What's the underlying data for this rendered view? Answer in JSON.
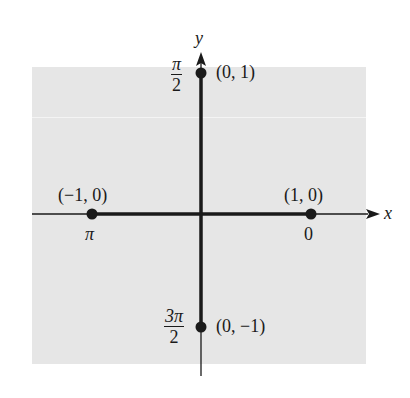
{
  "diagram": {
    "axes": {
      "x_label": "x",
      "y_label": "y"
    },
    "colors": {
      "background_box": "#e6e6e6",
      "ink": "#1a1a1a"
    },
    "points": [
      {
        "coord": "(1, 0)",
        "angle": "0"
      },
      {
        "coord": "(0, 1)",
        "angle_num": "π",
        "angle_den": "2"
      },
      {
        "coord": "(−1, 0)",
        "angle": "π"
      },
      {
        "coord": "(0, −1)",
        "angle_num": "3π",
        "angle_den": "2"
      }
    ]
  }
}
